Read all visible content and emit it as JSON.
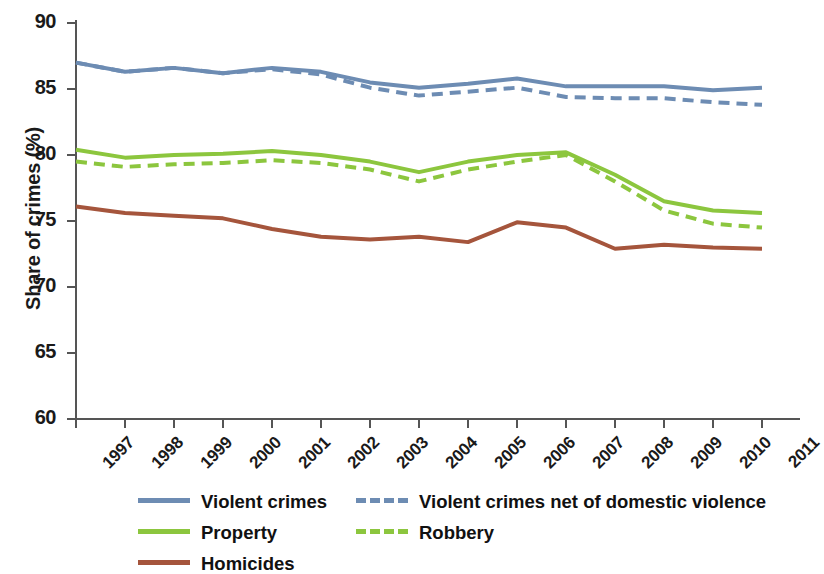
{
  "chart_data": {
    "type": "line",
    "title": "",
    "xlabel": "",
    "ylabel": "Share of crimes (%)",
    "ylim": [
      60,
      90
    ],
    "yticks": [
      60,
      65,
      70,
      75,
      80,
      85,
      90
    ],
    "grid": false,
    "legend_position": "bottom",
    "x": [
      1997,
      1998,
      1999,
      2000,
      2001,
      2002,
      2003,
      2004,
      2005,
      2006,
      2007,
      2008,
      2009,
      2010,
      2011
    ],
    "categories": [
      "1997",
      "1998",
      "1999",
      "2000",
      "2001",
      "2002",
      "2003",
      "2004",
      "2005",
      "2006",
      "2007",
      "2008",
      "2009",
      "2010",
      "2011"
    ],
    "series": [
      {
        "name": "Violent crimes",
        "style": "solid",
        "color": "#6d8cb3",
        "values": [
          87.0,
          86.3,
          86.6,
          86.2,
          86.6,
          86.3,
          85.5,
          85.1,
          85.4,
          85.8,
          85.2,
          85.2,
          85.2,
          84.9,
          85.1
        ]
      },
      {
        "name": "Violent crimes net of domestic violence",
        "style": "dashed",
        "color": "#6d8cb3",
        "values": [
          87.0,
          86.3,
          86.6,
          86.2,
          86.5,
          86.1,
          85.1,
          84.5,
          84.8,
          85.1,
          84.4,
          84.3,
          84.3,
          84.0,
          83.8
        ]
      },
      {
        "name": "Property",
        "style": "solid",
        "color": "#8cc63e",
        "values": [
          80.4,
          79.8,
          80.0,
          80.1,
          80.3,
          80.0,
          79.5,
          78.7,
          79.5,
          80.0,
          80.2,
          78.5,
          76.5,
          75.8,
          75.6
        ]
      },
      {
        "name": "Robbery",
        "style": "dashed",
        "color": "#8cc63e",
        "values": [
          79.5,
          79.1,
          79.3,
          79.4,
          79.6,
          79.4,
          78.9,
          78.0,
          78.9,
          79.5,
          80.0,
          78.0,
          75.8,
          74.8,
          74.5
        ]
      },
      {
        "name": "Homicides",
        "style": "solid",
        "color": "#a5553c",
        "values": [
          76.1,
          75.6,
          75.4,
          75.2,
          74.4,
          73.8,
          73.6,
          73.8,
          73.4,
          74.9,
          74.5,
          72.9,
          73.2,
          73.0,
          72.9
        ]
      }
    ]
  },
  "axis": {
    "ylabel": "Share of crimes (%)",
    "ytick_labels": [
      "90",
      "85",
      "80",
      "75",
      "70",
      "65",
      "60"
    ],
    "xtick_labels": [
      "1997",
      "1998",
      "1999",
      "2000",
      "2001",
      "2002",
      "2003",
      "2004",
      "2005",
      "2006",
      "2007",
      "2008",
      "2009",
      "2010",
      "2011"
    ]
  },
  "legend": {
    "rows": [
      [
        {
          "label": "Violent crimes",
          "color": "#6d8cb3",
          "style": "solid"
        },
        {
          "label": "Violent crimes net of domestic violence",
          "color": "#6d8cb3",
          "style": "dashed"
        }
      ],
      [
        {
          "label": "Property",
          "color": "#8cc63e",
          "style": "solid"
        },
        {
          "label": "Robbery",
          "color": "#8cc63e",
          "style": "dashed"
        }
      ],
      [
        {
          "label": "Homicides",
          "color": "#a5553c",
          "style": "solid"
        }
      ]
    ]
  }
}
